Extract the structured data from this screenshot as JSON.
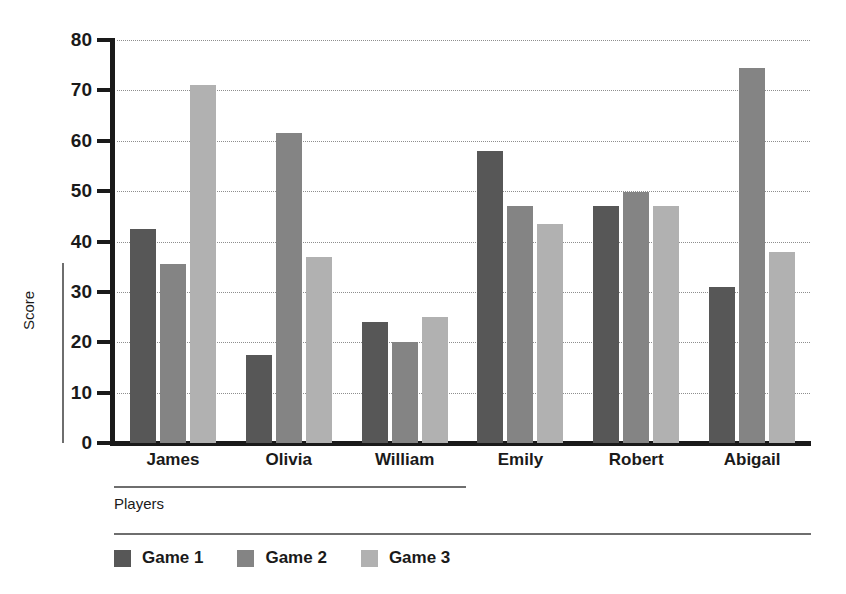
{
  "chart_data": {
    "type": "bar",
    "title": "",
    "subtitle": "",
    "xlabel": "Players",
    "ylabel": "Score",
    "categories": [
      "James",
      "Olivia",
      "William",
      "Emily",
      "Robert",
      "Abigail"
    ],
    "series": [
      {
        "name": "Game 1",
        "color": "#575757",
        "values": [
          42.5,
          17.5,
          24,
          58,
          47,
          31
        ]
      },
      {
        "name": "Game 2",
        "color": "#848484",
        "values": [
          35.5,
          61.5,
          20,
          47,
          49.8,
          74.5
        ]
      },
      {
        "name": "Game 3",
        "color": "#b1b1b1",
        "values": [
          71,
          37,
          25,
          43.5,
          47,
          38
        ]
      }
    ],
    "ylim": [
      0,
      80
    ],
    "ytick_step": 10,
    "ytick_labels": [
      "80",
      "70",
      "60",
      "50",
      "40",
      "30",
      "20",
      "10",
      "0"
    ],
    "grid": true,
    "grid_style": "dotted",
    "legend_position": "bottom-left",
    "annotations": []
  }
}
